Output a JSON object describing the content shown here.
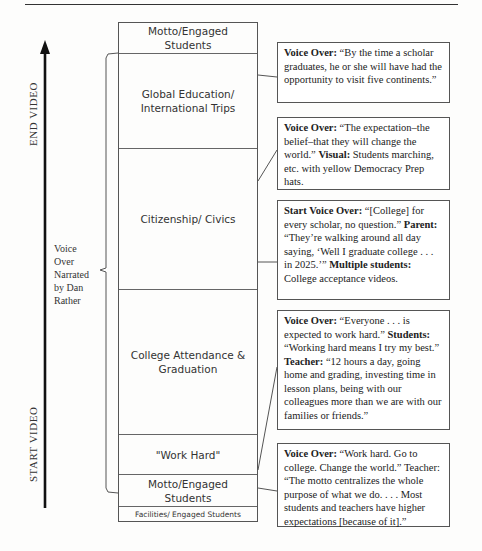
{
  "timeline": {
    "start_label": "START VIDEO",
    "end_label": "END VIDEO",
    "narration_label": [
      "Voice",
      "Over",
      "Narrated",
      "by Dan",
      "Rather"
    ]
  },
  "segments": [
    {
      "label": "Motto/Engaged Students"
    },
    {
      "label": "Global Education/ International Trips"
    },
    {
      "label": "Citizenship/ Civics"
    },
    {
      "label": "College Attendance & Graduation"
    },
    {
      "label": "\"Work Hard\""
    },
    {
      "label": "Motto/Engaged Students"
    },
    {
      "label": "Facilities/ Engaged Students"
    }
  ],
  "callouts": [
    {
      "parts": [
        {
          "b": "Voice Over:",
          "t": " “By the time a scholar graduates, he or she will have had the opportunity to visit five continents.”"
        }
      ]
    },
    {
      "parts": [
        {
          "b": "Voice Over:",
          "t": " “The expectation–the belief–that they will change the world.” "
        },
        {
          "b": "Visual:",
          "t": " Students marching, etc. with yellow Democracy Prep hats."
        }
      ]
    },
    {
      "parts": [
        {
          "b": "Start Voice Over:",
          "t": " “[College] for every scholar, no question.” "
        },
        {
          "b": "Parent:",
          "t": " “They’re walking around all day saying, ‘Well I graduate college . . . in 2025.’” "
        },
        {
          "b": "Multiple students:",
          "t": " College acceptance videos."
        }
      ]
    },
    {
      "parts": [
        {
          "b": "Voice Over:",
          "t": " “Everyone . . . is expected to work hard.” "
        },
        {
          "b": "Students:",
          "t": " “Working hard means I try my best.” "
        },
        {
          "b": "Teacher:",
          "t": " “12 hours a day, going home and grading, investing time in lesson plans, being with our colleagues more than we are with our families or friends.”"
        }
      ]
    },
    {
      "parts": [
        {
          "b": "Voice Over:",
          "t": " “Work hard. Go to college. Change the world.” Teacher: “The motto centralizes the whole purpose of what we do. . . . Most students and teachers have higher expectations [because of it].”"
        }
      ]
    }
  ]
}
